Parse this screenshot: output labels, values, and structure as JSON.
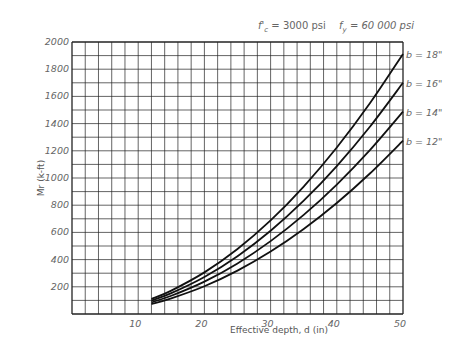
{
  "chart_data": {
    "type": "line",
    "title": "f'c = 3000 psi    fy = 60 000 psi",
    "title_parts": {
      "fc_label": "f'",
      "fc_sub": "c",
      "fc_value": " = 3000 psi",
      "fy_label": "f",
      "fy_sub": "y",
      "fy_value": " = 60 000 psi"
    },
    "xlabel": "Effective depth, d (in)",
    "ylabel": "Mr (k-ft)",
    "xlim": [
      0,
      50
    ],
    "ylim": [
      0,
      2000
    ],
    "x_ticks": [
      10,
      20,
      30,
      40,
      50
    ],
    "y_ticks": [
      200,
      400,
      600,
      800,
      1000,
      1200,
      1400,
      1600,
      1800,
      2000
    ],
    "grid": {
      "on": true,
      "x_step": 2,
      "y_step": 100
    },
    "legend_position": "right, at curve ends",
    "x": [
      12,
      15,
      20,
      25,
      30,
      35,
      40,
      45,
      50
    ],
    "series": [
      {
        "name": "b = 18\"",
        "values": [
          110,
          172,
          306,
          478,
          688,
          937,
          1224,
          1549,
          1912
        ]
      },
      {
        "name": "b = 16\"",
        "values": [
          98,
          153,
          272,
          425,
          612,
          833,
          1088,
          1377,
          1700
        ]
      },
      {
        "name": "b = 14\"",
        "values": [
          86,
          134,
          238,
          372,
          536,
          729,
          952,
          1205,
          1488
        ]
      },
      {
        "name": "b = 12\"",
        "values": [
          73,
          115,
          204,
          319,
          459,
          625,
          816,
          1033,
          1275
        ]
      }
    ]
  },
  "colors": {
    "grid": "#222222",
    "curve": "#111111",
    "text": "#666666"
  }
}
